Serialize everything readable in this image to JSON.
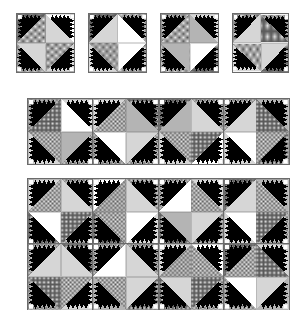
{
  "figure": {
    "kind": "quilt-block-layout-diagram",
    "background_color": "#ffffff",
    "line_color": "#4a4a4a",
    "block_outline_color": "#6b6b6b"
  },
  "palette": {
    "black": "#000000",
    "white": "#ffffff",
    "light_gray": "#d6d6d6",
    "mid_gray": "#b4b4b4",
    "dot_fill": "#ededed",
    "dot_ink": "#555555",
    "grid_fill": "#e3e3e3",
    "grid_ink": "#5a5a5a",
    "hatch_fill": "#dcdcdc",
    "hatch_ink": "#4f4f4f"
  },
  "fills": {
    "names": [
      "black",
      "white",
      "light-gray",
      "dotted",
      "grid",
      "hatch",
      "mid-gray"
    ],
    "legend_visible": false
  },
  "unit": {
    "name": "sawtooth-tree-quadrant",
    "teeth_count": 5,
    "has_corner_square": true,
    "description": "Large half-square diagonal triangle with a row of black sawtooth teeth along each short side and a small square in the corner."
  },
  "panels": [
    {
      "id": "single-block-1",
      "label": "Block 1",
      "x": 16,
      "y": 13,
      "w": 59,
      "h": 60,
      "cols": 1,
      "rows": 1,
      "blocks": [
        {
          "quadrants": [
            {
              "rot": 0,
              "tri": "dotted",
              "bg": "grid"
            },
            {
              "rot": 90,
              "tri": "light-gray",
              "bg": "white"
            },
            {
              "rot": 270,
              "tri": "light-gray",
              "bg": "hatch"
            },
            {
              "rot": 180,
              "tri": "dotted",
              "bg": "light-gray"
            }
          ]
        }
      ]
    },
    {
      "id": "single-block-2",
      "label": "Block 2",
      "x": 88,
      "y": 13,
      "w": 59,
      "h": 60,
      "cols": 1,
      "rows": 1,
      "blocks": [
        {
          "quadrants": [
            {
              "rot": 0,
              "tri": "light-gray",
              "bg": "grid"
            },
            {
              "rot": 90,
              "tri": "white",
              "bg": "dotted"
            },
            {
              "rot": 270,
              "tri": "hatch",
              "bg": "light-gray"
            },
            {
              "rot": 180,
              "tri": "white",
              "bg": "dotted"
            }
          ]
        }
      ]
    },
    {
      "id": "single-block-3",
      "label": "Block 3",
      "x": 160,
      "y": 13,
      "w": 59,
      "h": 60,
      "cols": 1,
      "rows": 1,
      "blocks": [
        {
          "quadrants": [
            {
              "rot": 0,
              "tri": "dotted",
              "bg": "hatch"
            },
            {
              "rot": 90,
              "tri": "mid-gray",
              "bg": "light-gray"
            },
            {
              "rot": 270,
              "tri": "mid-gray",
              "bg": "dotted"
            },
            {
              "rot": 180,
              "tri": "white",
              "bg": "grid"
            }
          ]
        }
      ]
    },
    {
      "id": "single-block-4",
      "label": "Block 4",
      "x": 232,
      "y": 13,
      "w": 57,
      "h": 60,
      "cols": 1,
      "rows": 1,
      "blocks": [
        {
          "quadrants": [
            {
              "rot": 0,
              "tri": "light-gray",
              "bg": "dotted"
            },
            {
              "rot": 90,
              "tri": "grid",
              "bg": "hatch"
            },
            {
              "rot": 270,
              "tri": "dotted",
              "bg": "light-gray"
            },
            {
              "rot": 180,
              "tri": "light-gray",
              "bg": "grid"
            }
          ]
        }
      ]
    },
    {
      "id": "row-band",
      "label": "Four-block row",
      "x": 27,
      "y": 98,
      "w": 263,
      "h": 61,
      "cols": 4,
      "rows": 1,
      "blocks": [
        {
          "quadrants": [
            {
              "rot": 0,
              "tri": "grid",
              "bg": "hatch"
            },
            {
              "rot": 90,
              "tri": "white",
              "bg": "light-gray"
            },
            {
              "rot": 270,
              "tri": "dotted",
              "bg": "light-gray"
            },
            {
              "rot": 180,
              "tri": "mid-gray",
              "bg": "dotted"
            }
          ]
        },
        {
          "quadrants": [
            {
              "rot": 0,
              "tri": "dotted",
              "bg": "light-gray"
            },
            {
              "rot": 90,
              "tri": "mid-gray",
              "bg": "grid"
            },
            {
              "rot": 270,
              "tri": "white",
              "bg": "hatch"
            },
            {
              "rot": 180,
              "tri": "light-gray",
              "bg": "dotted"
            }
          ]
        },
        {
          "quadrants": [
            {
              "rot": 0,
              "tri": "mid-gray",
              "bg": "grid"
            },
            {
              "rot": 90,
              "tri": "light-gray",
              "bg": "hatch"
            },
            {
              "rot": 270,
              "tri": "dotted",
              "bg": "light-gray"
            },
            {
              "rot": 180,
              "tri": "grid",
              "bg": "white"
            }
          ]
        },
        {
          "quadrants": [
            {
              "rot": 0,
              "tri": "light-gray",
              "bg": "dotted"
            },
            {
              "rot": 90,
              "tri": "grid",
              "bg": "mid-gray"
            },
            {
              "rot": 270,
              "tri": "white",
              "bg": "light-gray"
            },
            {
              "rot": 180,
              "tri": "dotted",
              "bg": "grid"
            }
          ]
        }
      ]
    },
    {
      "id": "quilt-panel",
      "label": "Four-by-two quilt layout",
      "x": 27,
      "y": 178,
      "w": 263,
      "h": 119,
      "cols": 4,
      "rows": 2,
      "blocks": [
        {
          "quadrants": [
            {
              "rot": 0,
              "tri": "dotted",
              "bg": "light-gray"
            },
            {
              "rot": 90,
              "tri": "light-gray",
              "bg": "hatch"
            },
            {
              "rot": 270,
              "tri": "white",
              "bg": "grid"
            },
            {
              "rot": 180,
              "tri": "grid",
              "bg": "dotted"
            }
          ]
        },
        {
          "quadrants": [
            {
              "rot": 0,
              "tri": "hatch",
              "bg": "white"
            },
            {
              "rot": 90,
              "tri": "light-gray",
              "bg": "dotted"
            },
            {
              "rot": 270,
              "tri": "dotted",
              "bg": "grid"
            },
            {
              "rot": 180,
              "tri": "white",
              "bg": "light-gray"
            }
          ]
        },
        {
          "quadrants": [
            {
              "rot": 0,
              "tri": "white",
              "bg": "dotted"
            },
            {
              "rot": 90,
              "tri": "dotted",
              "bg": "light-gray"
            },
            {
              "rot": 270,
              "tri": "mid-gray",
              "bg": "grid"
            },
            {
              "rot": 180,
              "tri": "light-gray",
              "bg": "hatch"
            }
          ]
        },
        {
          "quadrants": [
            {
              "rot": 0,
              "tri": "light-gray",
              "bg": "grid"
            },
            {
              "rot": 90,
              "tri": "dotted",
              "bg": "mid-gray"
            },
            {
              "rot": 270,
              "tri": "white",
              "bg": "light-gray"
            },
            {
              "rot": 180,
              "tri": "grid",
              "bg": "dotted"
            }
          ]
        },
        {
          "quadrants": [
            {
              "rot": 0,
              "tri": "light-gray",
              "bg": "dotted"
            },
            {
              "rot": 90,
              "tri": "light-gray",
              "bg": "grid"
            },
            {
              "rot": 270,
              "tri": "grid",
              "bg": "hatch"
            },
            {
              "rot": 180,
              "tri": "dotted",
              "bg": "light-gray"
            }
          ]
        },
        {
          "quadrants": [
            {
              "rot": 0,
              "tri": "white",
              "bg": "dotted"
            },
            {
              "rot": 90,
              "tri": "light-gray",
              "bg": "hatch"
            },
            {
              "rot": 270,
              "tri": "dotted",
              "bg": "mid-gray"
            },
            {
              "rot": 180,
              "tri": "light-gray",
              "bg": "grid"
            }
          ]
        },
        {
          "quadrants": [
            {
              "rot": 0,
              "tri": "hatch",
              "bg": "light-gray"
            },
            {
              "rot": 90,
              "tri": "dotted",
              "bg": "white"
            },
            {
              "rot": 270,
              "tri": "light-gray",
              "bg": "grid"
            },
            {
              "rot": 180,
              "tri": "grid",
              "bg": "dotted"
            }
          ]
        },
        {
          "quadrants": [
            {
              "rot": 0,
              "tri": "dotted",
              "bg": "grid"
            },
            {
              "rot": 90,
              "tri": "grid",
              "bg": "light-gray"
            },
            {
              "rot": 270,
              "tri": "white",
              "bg": "dotted"
            },
            {
              "rot": 180,
              "tri": "light-gray",
              "bg": "mid-gray"
            }
          ]
        }
      ]
    }
  ]
}
